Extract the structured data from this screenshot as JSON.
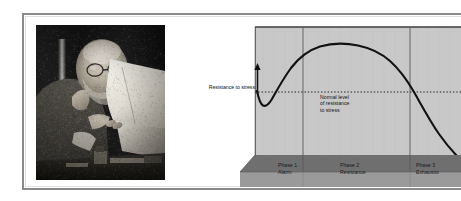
{
  "page": {
    "background_color": "#ffffff",
    "frame_border_color": "#8a8a8a"
  },
  "photo": {
    "caption_alt": "freud-reading-photograph",
    "description": "Black and white photograph of Sigmund Freud seated at a desk reading papers",
    "tone": "grayscale"
  },
  "chart": {
    "axis_label": "Resistance to stress",
    "baseline_note_line1": "Normal level",
    "baseline_note_line2": "of resistance",
    "baseline_note_line3": "to stress",
    "panel_color": "#c8c8c8",
    "base_color": "#9a9a9a",
    "base_shadow_color": "#6f6f6f",
    "curve_color": "#111111",
    "border_color": "#4a4a4a",
    "phases": [
      {
        "name": "Phase 1",
        "subtitle": "Alarm"
      },
      {
        "name": "Phase 2",
        "subtitle": "Resistance"
      },
      {
        "name": "Phase 3",
        "subtitle": "Exhaustio"
      }
    ]
  },
  "chart_data": {
    "type": "line",
    "title": "",
    "xlabel": "",
    "ylabel": "Resistance to stress",
    "xlim": [
      0,
      100
    ],
    "ylim": [
      0,
      100
    ],
    "grid": false,
    "legend": "none",
    "annotations": [
      "Resistance to stress",
      "Normal level of resistance to stress"
    ],
    "categories": [
      "Phase 1 Alarm",
      "Phase 2 Resistance",
      "Phase 3 Exhaustion"
    ],
    "phase_boundaries_x": [
      0,
      30,
      84,
      100
    ],
    "baseline_y": 50,
    "baseline_style": "dotted",
    "series": [
      {
        "name": "Resistance to stress",
        "x": [
          0,
          3,
          6,
          9,
          13,
          18,
          24,
          30,
          38,
          46,
          54,
          62,
          70,
          78,
          84,
          90,
          95,
          100
        ],
        "values": [
          50,
          43,
          38,
          37,
          40,
          49,
          61,
          72,
          82,
          88,
          91,
          91,
          89,
          83,
          75,
          62,
          50,
          34
        ]
      }
    ]
  }
}
